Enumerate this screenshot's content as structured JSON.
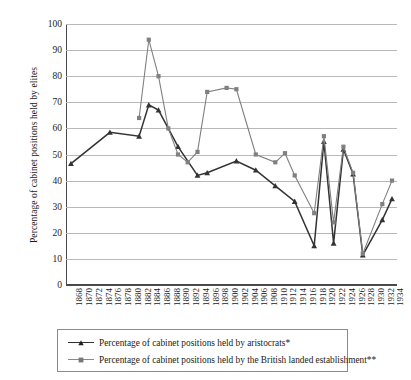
{
  "chart_data": {
    "type": "line",
    "title": "",
    "xlabel": "",
    "ylabel": "Percentage of cabinet positions held by elites",
    "ylim": [
      0,
      100
    ],
    "ytick_step": 10,
    "yticks": [
      0,
      10,
      20,
      30,
      40,
      50,
      60,
      70,
      80,
      90,
      100
    ],
    "grid": true,
    "legend_position": "bottom",
    "categories": [
      "1868",
      "1870",
      "1872",
      "1874",
      "1876",
      "1878",
      "1880",
      "1882",
      "1884",
      "1886",
      "1888",
      "1890",
      "1892",
      "1894",
      "1896",
      "1898",
      "1900",
      "1902",
      "1904",
      "1906",
      "1908",
      "1910",
      "1912",
      "1914",
      "1916",
      "1918",
      "1920",
      "1922",
      "1924",
      "1926",
      "1928",
      "1930",
      "1932",
      "1934"
    ],
    "series": [
      {
        "name": "Percentage of cabinet positions held by aristocrats*",
        "color": "#333333",
        "marker": "triangle",
        "values": [
          46.5,
          null,
          null,
          null,
          58.5,
          null,
          null,
          57.0,
          69.0,
          67.0,
          null,
          53.0,
          null,
          42.0,
          43.0,
          null,
          null,
          47.5,
          null,
          44.0,
          null,
          38.0,
          null,
          32.0,
          null,
          15.0,
          55.0,
          16.0,
          52.0,
          42.5,
          11.5,
          null,
          25.0,
          33.0
        ]
      },
      {
        "name": "Percentage of cabinet positions held by the British landed establishment**",
        "color": "#808080",
        "marker": "square",
        "values": [
          null,
          null,
          null,
          null,
          null,
          null,
          null,
          64.0,
          94.0,
          80.0,
          60.0,
          50.0,
          47.0,
          51.0,
          74.0,
          null,
          75.5,
          75.0,
          null,
          50.0,
          null,
          47.0,
          50.5,
          42.0,
          null,
          27.5,
          57.0,
          24.0,
          53.0,
          43.0,
          12.0,
          null,
          31.0,
          40.0
        ]
      }
    ]
  }
}
